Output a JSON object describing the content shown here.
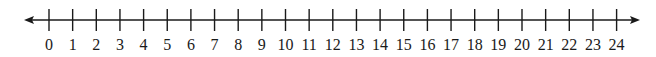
{
  "diagram": {
    "type": "number-line",
    "min": 0,
    "max": 24,
    "step": 1,
    "arrows": "both",
    "line_color": "#1a1a1a",
    "labels": [
      "0",
      "1",
      "2",
      "3",
      "4",
      "5",
      "6",
      "7",
      "8",
      "9",
      "10",
      "11",
      "12",
      "13",
      "14",
      "15",
      "16",
      "17",
      "18",
      "19",
      "20",
      "21",
      "22",
      "23",
      "24"
    ]
  },
  "layout": {
    "line_y": 20,
    "line_start_x": 24,
    "line_end_x": 640,
    "first_tick_x": 49,
    "tick_spacing": 23.65,
    "tick_top": 9,
    "tick_bottom": 31,
    "label_y": 50
  }
}
